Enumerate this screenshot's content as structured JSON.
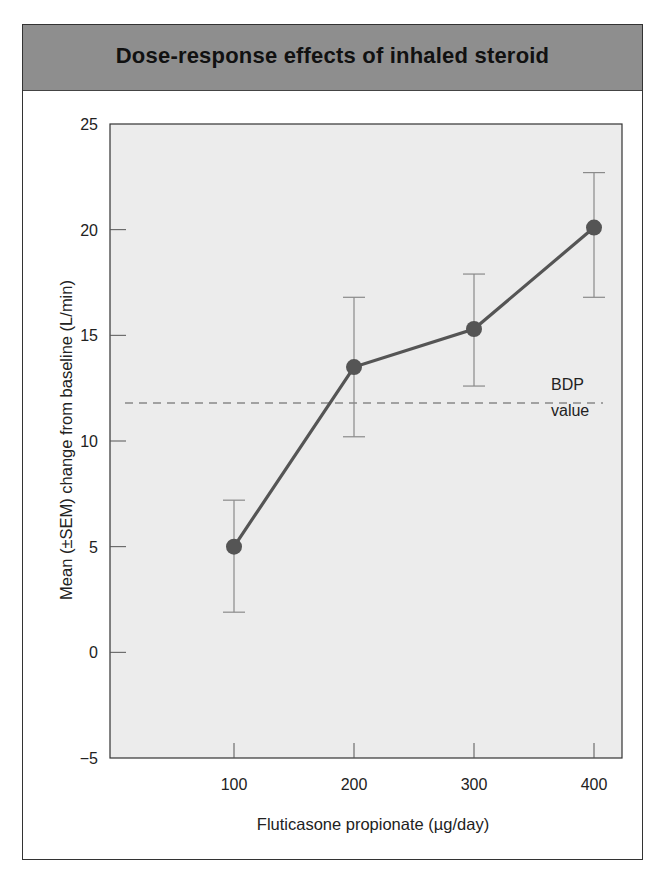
{
  "header": {
    "title": "Dose-response effects of inhaled steroid"
  },
  "colors": {
    "header_bg": "#8e8e8e",
    "plot_bg": "#ececec",
    "series": "#555555",
    "error_bars": "#8a8a8a",
    "reference_line": "#888888"
  },
  "chart_data": {
    "type": "line",
    "title": "Dose-response effects of inhaled steroid",
    "xlabel": "Fluticasone propionate (µg/day)",
    "ylabel": "Mean (±SEM) change from baseline (L/min)",
    "x": [
      100,
      200,
      300,
      400
    ],
    "categories": [
      "100",
      "200",
      "300",
      "400"
    ],
    "series": [
      {
        "name": "Fluticasone propionate",
        "values": [
          5.0,
          13.5,
          15.3,
          20.1
        ],
        "error_upper": [
          7.2,
          16.8,
          17.9,
          22.7
        ],
        "error_lower": [
          1.9,
          10.2,
          12.6,
          16.8
        ],
        "marker": "filled-circle"
      }
    ],
    "reference_lines": [
      {
        "label_line1": "BDP",
        "label_line2": "value",
        "y": 11.8,
        "style": "dashed"
      }
    ],
    "ylim": [
      -5,
      25
    ],
    "yticks": [
      -5,
      0,
      5,
      10,
      15,
      20,
      25
    ],
    "ytick_labels": [
      "−5",
      "0",
      "5",
      "10",
      "15",
      "20",
      "25"
    ],
    "xticks": [
      100,
      200,
      300,
      400
    ],
    "xtick_labels": [
      "100",
      "200",
      "300",
      "400"
    ],
    "grid": false,
    "legend": "none"
  }
}
